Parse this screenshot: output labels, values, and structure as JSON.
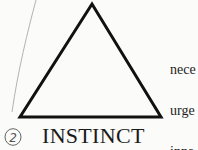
{
  "diagram": {
    "shape": "triangle",
    "label": "INSTINCT",
    "annotation_number": "2",
    "side_text_lines": [
      "nece",
      "urge",
      "inna",
      "men"
    ]
  },
  "colors": {
    "ink": "#1a1a1a",
    "pencil": "#9a9a9a",
    "paper": "#fbfbf9"
  }
}
